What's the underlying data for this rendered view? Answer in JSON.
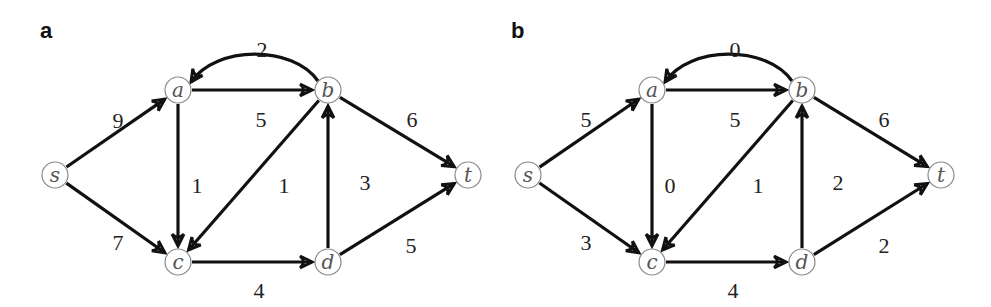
{
  "figure": {
    "panels": [
      {
        "label": "a",
        "nodes": [
          {
            "id": "s",
            "x": 55,
            "y": 175
          },
          {
            "id": "a",
            "x": 178,
            "y": 90
          },
          {
            "id": "b",
            "x": 328,
            "y": 90
          },
          {
            "id": "c",
            "x": 178,
            "y": 262
          },
          {
            "id": "d",
            "x": 328,
            "y": 262
          },
          {
            "id": "t",
            "x": 468,
            "y": 175
          }
        ],
        "edges": [
          {
            "from": "s",
            "to": "a",
            "weight": "9",
            "lx": 118,
            "ly": 123
          },
          {
            "from": "s",
            "to": "c",
            "weight": "7",
            "lx": 118,
            "ly": 245
          },
          {
            "from": "a",
            "to": "b",
            "weight": "5",
            "lx": 261,
            "ly": 122
          },
          {
            "from": "b",
            "to": "a",
            "weight": "2",
            "lx": 262,
            "ly": 52,
            "curved": true
          },
          {
            "from": "a",
            "to": "c",
            "weight": "1",
            "lx": 197,
            "ly": 188
          },
          {
            "from": "b",
            "to": "c",
            "weight": "1",
            "lx": 284,
            "ly": 188
          },
          {
            "from": "c",
            "to": "d",
            "weight": "4",
            "lx": 259,
            "ly": 293
          },
          {
            "from": "d",
            "to": "b",
            "weight": "3",
            "lx": 365,
            "ly": 185
          },
          {
            "from": "b",
            "to": "t",
            "weight": "6",
            "lx": 412,
            "ly": 122
          },
          {
            "from": "d",
            "to": "t",
            "weight": "5",
            "lx": 411,
            "ly": 248
          }
        ]
      },
      {
        "label": "b",
        "nodes": [
          {
            "id": "s",
            "x": 528,
            "y": 175
          },
          {
            "id": "a",
            "x": 652,
            "y": 90
          },
          {
            "id": "b",
            "x": 802,
            "y": 90
          },
          {
            "id": "c",
            "x": 652,
            "y": 262
          },
          {
            "id": "d",
            "x": 802,
            "y": 262
          },
          {
            "id": "t",
            "x": 941,
            "y": 175
          }
        ],
        "edges": [
          {
            "from": "s",
            "to": "a",
            "weight": "5",
            "lx": 586,
            "ly": 122
          },
          {
            "from": "s",
            "to": "c",
            "weight": "3",
            "lx": 586,
            "ly": 245
          },
          {
            "from": "a",
            "to": "b",
            "weight": "5",
            "lx": 735,
            "ly": 122
          },
          {
            "from": "b",
            "to": "a",
            "weight": "0",
            "lx": 735,
            "ly": 52,
            "curved": true
          },
          {
            "from": "a",
            "to": "c",
            "weight": "0",
            "lx": 670,
            "ly": 188
          },
          {
            "from": "b",
            "to": "c",
            "weight": "1",
            "lx": 758,
            "ly": 188
          },
          {
            "from": "c",
            "to": "d",
            "weight": "4",
            "lx": 733,
            "ly": 293
          },
          {
            "from": "d",
            "to": "b",
            "weight": "2",
            "lx": 838,
            "ly": 185
          },
          {
            "from": "b",
            "to": "t",
            "weight": "6",
            "lx": 884,
            "ly": 122
          },
          {
            "from": "d",
            "to": "t",
            "weight": "2",
            "lx": 884,
            "ly": 248
          }
        ]
      }
    ],
    "panel_label_positions": [
      {
        "x": 40,
        "y": 38
      },
      {
        "x": 511,
        "y": 38
      }
    ],
    "style": {
      "edge_color": "#111111",
      "node_stroke": "#8a8a8a",
      "node_radius": 13
    }
  }
}
